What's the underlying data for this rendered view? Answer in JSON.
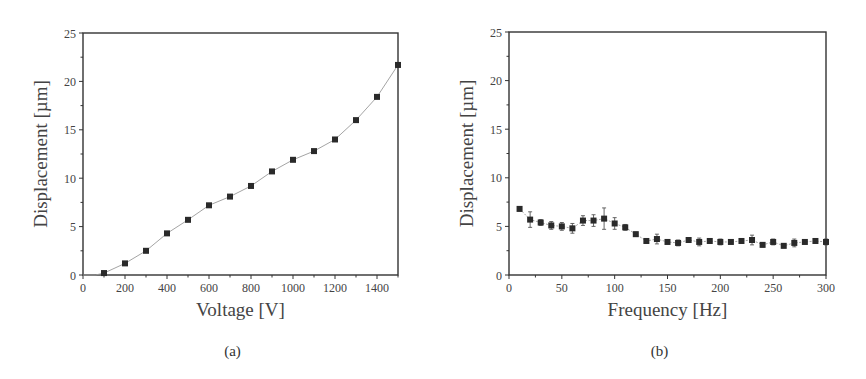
{
  "chart_data": [
    {
      "id": "a",
      "type": "line",
      "caption": "(a)",
      "title": "",
      "xlabel": "Voltage [V]",
      "ylabel": "Displacement [µm]",
      "xlim": [
        0,
        1500
      ],
      "ylim": [
        0,
        25
      ],
      "xticks": [
        0,
        200,
        400,
        600,
        800,
        1000,
        1200,
        1400
      ],
      "xtick_labels": [
        "0",
        "200",
        "400",
        "600",
        "800",
        "1000",
        "1200",
        "1400"
      ],
      "yticks": [
        0,
        5,
        10,
        15,
        20,
        25
      ],
      "ytick_labels": [
        "0",
        "5",
        "10",
        "15",
        "20",
        "25"
      ],
      "grid": false,
      "legend": null,
      "series": [
        {
          "name": "Displacement vs Voltage",
          "marker": "square",
          "line": "thin gray connecting line",
          "x": [
            100,
            200,
            300,
            400,
            500,
            600,
            700,
            800,
            900,
            1000,
            1100,
            1200,
            1300,
            1400,
            1500
          ],
          "y": [
            0.2,
            1.2,
            2.5,
            4.3,
            5.7,
            7.2,
            8.1,
            9.2,
            10.7,
            11.9,
            12.8,
            14.0,
            16.0,
            18.4,
            21.7
          ]
        }
      ]
    },
    {
      "id": "b",
      "type": "line",
      "caption": "(b)",
      "title": "",
      "xlabel": "Frequency [Hz]",
      "ylabel": "Displacement [µm]",
      "xlim": [
        0,
        300
      ],
      "ylim": [
        0,
        25
      ],
      "xticks": [
        0,
        50,
        100,
        150,
        200,
        250,
        300
      ],
      "xtick_labels": [
        "0",
        "50",
        "100",
        "150",
        "200",
        "250",
        "300"
      ],
      "yticks": [
        0,
        5,
        10,
        15,
        20,
        25
      ],
      "ytick_labels": [
        "0",
        "5",
        "10",
        "15",
        "20",
        "25"
      ],
      "grid": false,
      "legend": null,
      "series": [
        {
          "name": "Displacement vs Frequency",
          "marker": "square",
          "line": "thin gray connecting line",
          "error_bars": true,
          "x": [
            10,
            20,
            30,
            40,
            50,
            60,
            70,
            80,
            90,
            100,
            110,
            120,
            130,
            140,
            150,
            160,
            170,
            180,
            190,
            200,
            210,
            220,
            230,
            240,
            250,
            260,
            270,
            280,
            290,
            300
          ],
          "y": [
            6.8,
            5.7,
            5.4,
            5.1,
            5.0,
            4.8,
            5.6,
            5.6,
            5.8,
            5.3,
            4.9,
            4.2,
            3.5,
            3.7,
            3.4,
            3.3,
            3.6,
            3.4,
            3.5,
            3.4,
            3.4,
            3.5,
            3.6,
            3.1,
            3.4,
            3.0,
            3.3,
            3.4,
            3.5,
            3.4
          ],
          "yerr": [
            0.2,
            0.8,
            0.3,
            0.4,
            0.4,
            0.5,
            0.5,
            0.6,
            1.1,
            0.6,
            0.3,
            0.2,
            0.2,
            0.5,
            0.2,
            0.3,
            0.2,
            0.4,
            0.2,
            0.3,
            0.2,
            0.2,
            0.5,
            0.2,
            0.3,
            0.2,
            0.4,
            0.2,
            0.2,
            0.3
          ]
        }
      ]
    }
  ]
}
